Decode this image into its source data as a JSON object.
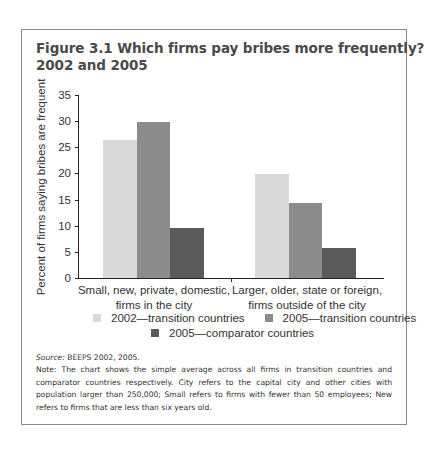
{
  "figure": {
    "title_line1": "Figure 3.1  Which firms pay bribes more frequently?",
    "title_line2": "2002 and 2005"
  },
  "chart_data": {
    "type": "bar",
    "title": "Which firms pay bribes more frequently? 2002 and 2005",
    "xlabel": "",
    "ylabel": "Percent of firms saying bribes are frequent",
    "ylim": [
      0,
      35
    ],
    "yticks": [
      "0",
      "5",
      "10",
      "15",
      "20",
      "25",
      "30",
      "35"
    ],
    "grid": false,
    "legend_position": "bottom",
    "categories": [
      "Small, new, private, domestic, firms in the city",
      "Larger, older, state or foreign, firms outside of the city"
    ],
    "category_lines": [
      [
        "Small, new, private, domestic,",
        "firms in the city"
      ],
      [
        "Larger, older, state or foreign,",
        "firms outside of the city"
      ]
    ],
    "series": [
      {
        "name": "2002—transition countries",
        "color": "#d9d9d9",
        "values": [
          26.4,
          19.9
        ]
      },
      {
        "name": "2005—transition countries",
        "color": "#8c8c8c",
        "values": [
          29.8,
          14.3
        ]
      },
      {
        "name": "2005—comparator countries",
        "color": "#5a5a5a",
        "values": [
          9.6,
          5.7
        ]
      }
    ]
  },
  "footer": {
    "source_label": "Source:",
    "source_text": " BEEPS 2002, 2005.",
    "note": "Note: The chart shows the simple average across all firms in transition countries and comparator countries respectively. City refers to the capital city and other cities with population larger than 250,000; Small refers to firms with fewer than 50 employees; New refers to firms that are less than six years old."
  }
}
